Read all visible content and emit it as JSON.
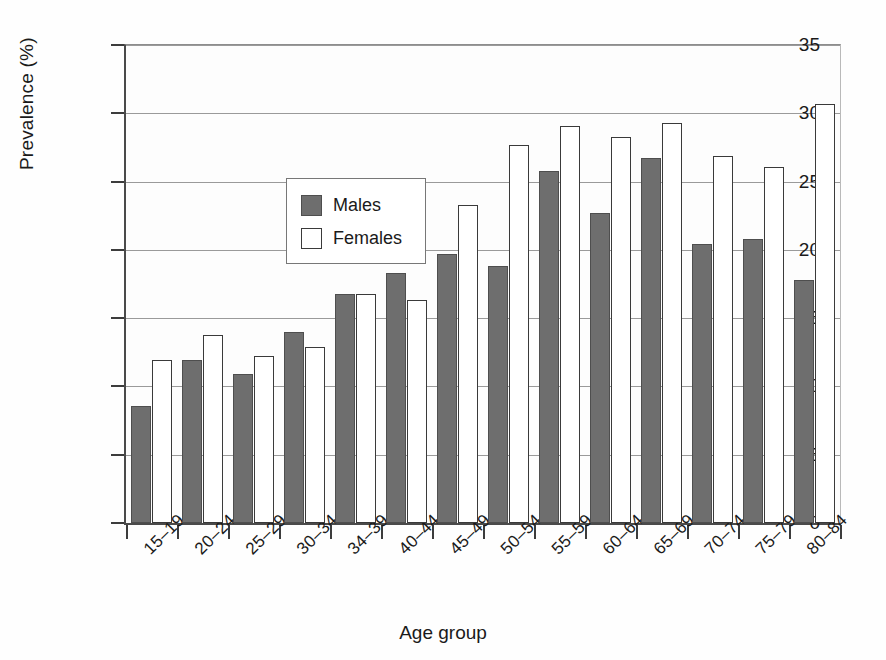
{
  "chart_data": {
    "type": "bar",
    "title": "",
    "xlabel": "Age group",
    "ylabel": "Prevalence (%)",
    "ylim": [
      0,
      35
    ],
    "yticks": [
      0,
      5,
      10,
      15,
      20,
      25,
      30,
      35
    ],
    "ytick_labels": [
      "0",
      "5",
      "10",
      "15",
      "20",
      "25",
      "30",
      "35"
    ],
    "grid": "horizontal",
    "legend_position": "upper-left-inside",
    "categories": [
      "15–19",
      "20–24",
      "25–29",
      "30–34",
      "34–39",
      "40–44",
      "45–49",
      "50–54",
      "55–59",
      "60–64",
      "65–69",
      "70–74",
      "75–79",
      "80–84"
    ],
    "series": [
      {
        "name": "Males",
        "color": "#6e6e6e",
        "values": [
          8.6,
          11.9,
          10.9,
          14.0,
          16.8,
          18.3,
          19.7,
          18.8,
          25.8,
          22.7,
          26.7,
          20.4,
          20.8,
          17.8
        ]
      },
      {
        "name": "Females",
        "color": "#ffffff",
        "values": [
          11.9,
          13.8,
          12.2,
          12.9,
          16.8,
          16.3,
          23.3,
          27.7,
          29.1,
          28.3,
          29.3,
          26.9,
          26.1,
          30.7
        ]
      }
    ]
  },
  "legend": {
    "items": [
      {
        "label": "Males"
      },
      {
        "label": "Females"
      }
    ]
  }
}
